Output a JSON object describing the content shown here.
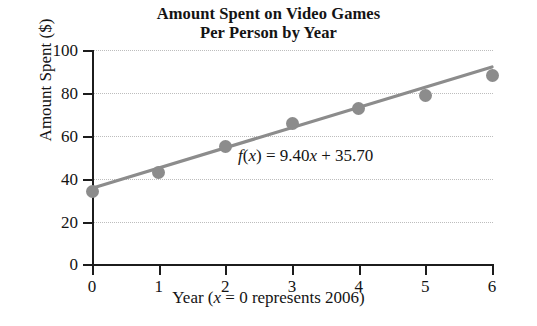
{
  "figure": {
    "title_line1": "Amount Spent on Video Games",
    "title_line2": "Per Person by Year",
    "equation_fx": "f",
    "equation_paren_open": "(",
    "equation_var": "x",
    "equation_paren_close": ")",
    "equation_rest": " = 9.40",
    "equation_var2": "x",
    "equation_tail": " + 35.70",
    "equation_full": "f(x) = 9.40x + 35.70",
    "xlabel_prefix": "Year (",
    "xlabel_var": "x",
    "xlabel_suffix": " = 0 represents 2006)",
    "ylabel": "Amount Spent ($)",
    "marker_color": "#8c8c8c",
    "line_color": "#8c8c8c",
    "axis_color": "#1c1c1c",
    "grid_color": "#bdbdbd",
    "page_bleed_text": ""
  },
  "chart_data": {
    "type": "scatter",
    "title": "Amount Spent on Video Games Per Person by Year",
    "xlabel": "Year (x = 0 represents 2006)",
    "ylabel": "Amount Spent ($)",
    "xlim": [
      0,
      6
    ],
    "ylim": [
      0,
      100
    ],
    "xticks": [
      0,
      1,
      2,
      3,
      4,
      5,
      6
    ],
    "yticks": [
      0,
      20,
      40,
      60,
      80,
      100
    ],
    "xtick_labels": [
      "0",
      "1",
      "2",
      "3",
      "4",
      "5",
      "6"
    ],
    "ytick_labels": [
      "0",
      "20",
      "40",
      "60",
      "80",
      "100"
    ],
    "grid": "horizontal-dotted",
    "legend": "none",
    "x": [
      0,
      1,
      2,
      3,
      4,
      5,
      6
    ],
    "series": [
      {
        "name": "Amount spent per person",
        "type": "scatter",
        "values": [
          34,
          43,
          55,
          66,
          73,
          79,
          88
        ],
        "marker": "circle",
        "color": "#8c8c8c"
      },
      {
        "name": "Linear model f(x) = 9.40x + 35.70",
        "type": "line",
        "slope": 9.4,
        "intercept": 35.7,
        "values": [
          35.7,
          45.1,
          54.5,
          63.9,
          73.3,
          82.7,
          92.1
        ],
        "color": "#8c8c8c"
      }
    ],
    "annotations": [
      {
        "text": "f(x) = 9.40x + 35.70",
        "x": 2.2,
        "y": 58
      }
    ]
  }
}
